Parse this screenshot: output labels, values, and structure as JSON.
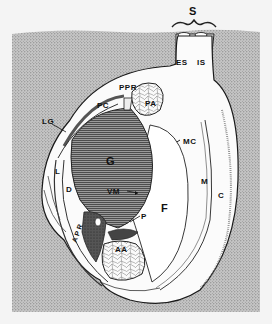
{
  "figure": {
    "colors": {
      "page_background": "#f4f4f4",
      "sediment": "#b8b8b8",
      "tissue": "#ffffff",
      "outline": "#1a1a1a",
      "muscle_hatch": "#555555"
    },
    "labels": {
      "S": "S",
      "ES": "ES",
      "IS": "IS",
      "PPR": "PPR",
      "PA": "PA",
      "PC": "PC",
      "LG": "LG",
      "G": "G",
      "MC": "MC",
      "L": "L",
      "D": "D",
      "VM": "VM",
      "M": "M",
      "C": "C",
      "F": "F",
      "P": "P",
      "APR": "APR",
      "AA": "AA"
    }
  }
}
